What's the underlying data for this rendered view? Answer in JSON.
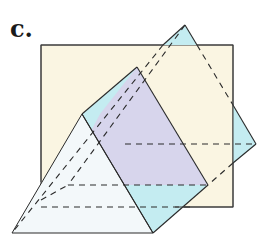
{
  "figure": {
    "label": "c.",
    "colors": {
      "vertical_plane": "#faf5e2",
      "inclined_plane": "#c4ecf1",
      "intersection_region": "#d7d5ec",
      "prism_face": "#f3f8fa",
      "edge": "#2a2a2a"
    }
  }
}
